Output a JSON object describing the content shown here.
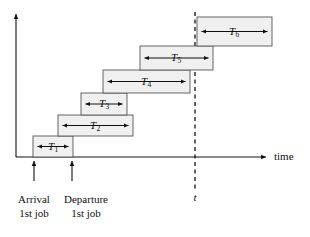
{
  "figure": {
    "kind": "timeline-diagram",
    "background_color": "#ffffff",
    "line_color": "#111111",
    "box_fill_color": "#f0f0f0",
    "box_stroke_color": "#555555"
  },
  "axes": {
    "time_axis_label": "time",
    "vertical_axis_label": "",
    "time_axis_y": 157,
    "vertical_axis_x": 16
  },
  "marker": {
    "label": "t",
    "x": 195,
    "style": "dashed"
  },
  "ticks": [
    {
      "name": "arrival-1st-job",
      "x": 34,
      "line1": "Arrival",
      "line2": "1st job"
    },
    {
      "name": "departure-1st-job",
      "x": 72,
      "line1": "Departure",
      "line2": "1st job"
    }
  ],
  "jobs": [
    {
      "id": "T1",
      "symbol": "T",
      "subscript": "1",
      "x": 33,
      "y": 136,
      "width": 40,
      "height": 21
    },
    {
      "id": "T2",
      "symbol": "T",
      "subscript": "2",
      "x": 58,
      "y": 115,
      "width": 75,
      "height": 21
    },
    {
      "id": "T3",
      "symbol": "T",
      "subscript": "3",
      "x": 81,
      "y": 93,
      "width": 46,
      "height": 22
    },
    {
      "id": "T4",
      "symbol": "T",
      "subscript": "4",
      "x": 103,
      "y": 70,
      "width": 87,
      "height": 23
    },
    {
      "id": "T5",
      "symbol": "T",
      "subscript": "5",
      "x": 140,
      "y": 46,
      "width": 73,
      "height": 24
    },
    {
      "id": "T6",
      "symbol": "T",
      "subscript": "6",
      "x": 197,
      "y": 17,
      "width": 75,
      "height": 29
    }
  ]
}
